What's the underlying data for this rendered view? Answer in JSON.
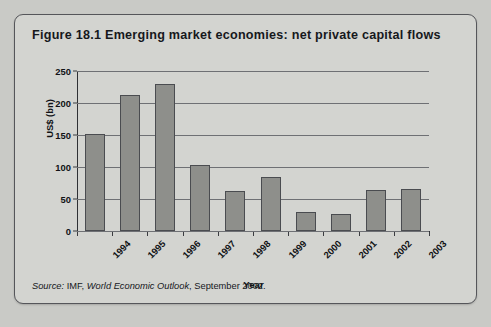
{
  "figure": {
    "title": "Figure 18.1  Emerging market economies: net private capital flows",
    "source_lead": "Source:",
    "source_body_pre": " IMF, ",
    "source_publication": "World Economic Outlook",
    "source_body_post": ", September 2002."
  },
  "colors": {
    "page_background": "#c9cac6",
    "panel_background": "#d3d4d0",
    "panel_border": "#55565a",
    "bar_fill": "#8e8f8b",
    "bar_stroke": "#4a4c50",
    "gridline": "#6e7074",
    "axis": "#2e3034",
    "text": "#101215"
  },
  "chart_data": {
    "type": "bar",
    "title": "Figure 18.1  Emerging market economies: net private capital flows",
    "xlabel": "Year",
    "ylabel": "US$ (bn)",
    "categories": [
      "1994",
      "1995",
      "1996",
      "1997",
      "1998",
      "1999",
      "2000",
      "2001",
      "2002",
      "2003"
    ],
    "values": [
      152,
      212,
      229,
      103,
      62,
      85,
      30,
      27,
      64,
      66
    ],
    "ylim": [
      0,
      250
    ],
    "yticks": [
      0,
      50,
      100,
      150,
      200,
      250
    ],
    "ytick_labels": [
      "0",
      "50",
      "100",
      "150",
      "200",
      "250"
    ],
    "grid": "horizontal",
    "legend": "none",
    "xtick_rotation": -45
  }
}
